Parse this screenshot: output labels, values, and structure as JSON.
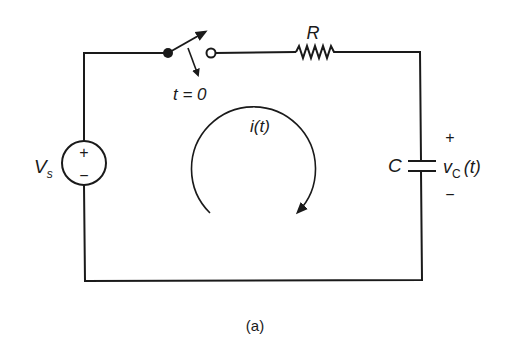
{
  "figure": {
    "caption": "(a)",
    "type": "RC series circuit with switch"
  },
  "components": {
    "source": {
      "label_main": "V",
      "label_sub": "s",
      "plus": "+",
      "minus": "−"
    },
    "switch": {
      "label": "t = 0"
    },
    "resistor": {
      "label": "R"
    },
    "capacitor": {
      "label": "C",
      "voltage_main": "v",
      "voltage_sub": "C",
      "voltage_arg": "(t)",
      "plus": "+",
      "minus": "−"
    },
    "current": {
      "label": "i(t)",
      "direction": "clockwise"
    }
  },
  "colors": {
    "ink": "#1a1a1a",
    "background": "#ffffff"
  }
}
